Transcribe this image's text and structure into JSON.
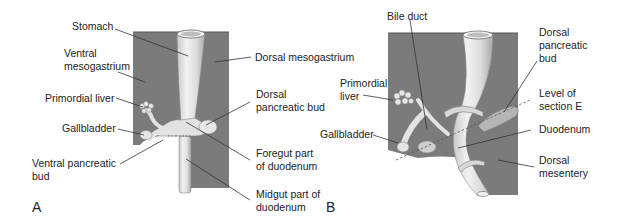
{
  "figure": {
    "panels": [
      {
        "id": "A",
        "letter": "A",
        "labels": {
          "stomach": "Stomach",
          "ventral_mesogastrium": "Ventral\nmesogastrium",
          "dorsal_mesogastrium": "Dorsal mesogastrium",
          "primordial_liver": "Primordial liver",
          "gallbladder": "Gallbladder",
          "ventral_pancreatic_bud": "Ventral pancreatic\nbud",
          "dorsal_pancreatic_bud": "Dorsal\npancreatic bud",
          "foregut_part_of_duodenum": "Foregut part\nof duodenum",
          "midgut_part_of_duodenum": "Midgut part of\nduodenum"
        }
      },
      {
        "id": "B",
        "letter": "B",
        "labels": {
          "bile_duct": "Bile duct",
          "primordial_liver": "Primordial\nliver",
          "gallbladder": "Gallbladder",
          "dorsal_pancreatic_bud": "Dorsal\npancreatic\nbud",
          "level_of_section_e": "Level of\nsection E",
          "duodenum": "Duodenum",
          "dorsal_mesentery": "Dorsal\nmesentery"
        }
      }
    ],
    "colors": {
      "mesentery": "#7b7b7b",
      "gut_tube": "#e4e4e4",
      "gut_shadow": "#a9a9a9",
      "leader_line": "#333333",
      "text": "#222222"
    }
  }
}
